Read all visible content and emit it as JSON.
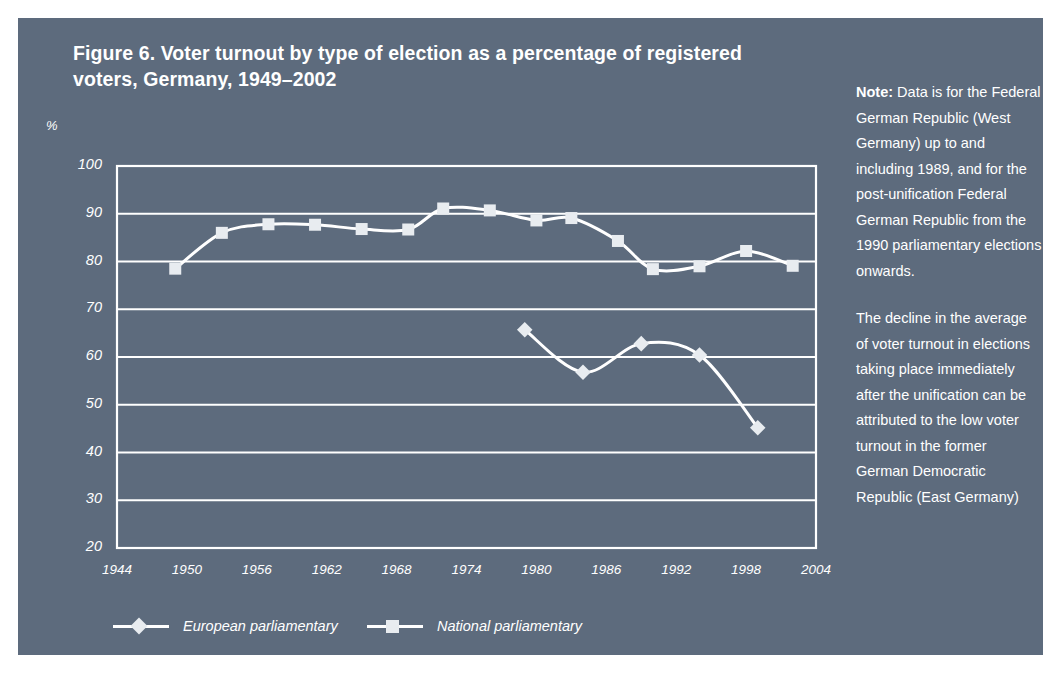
{
  "figure": {
    "title": "Figure 6. Voter turnout by type of election as a percentage of registered voters, Germany, 1949–2002",
    "panel_color": "#5d6b7d",
    "ink_color": "#ffffff",
    "marker_fill": "#e8ecf0"
  },
  "note": {
    "label": "Note:",
    "paragraph1": " Data is for the Federal German Republic (West Germany) up to and including 1989, and for the post-unification Federal German Republic from the 1990 parliamentary elections onwards.",
    "paragraph2": "The decline in the average of voter turnout in elections taking place immediately after the unification can be attributed to the low voter turnout in the former German Democratic Republic (East Germany)"
  },
  "chart_data": {
    "type": "line",
    "title": "Figure 6. Voter turnout by type of election as a percentage of registered voters, Germany, 1949–2002",
    "xlabel": "",
    "ylabel": "%",
    "xlim": [
      1944,
      2004
    ],
    "ylim": [
      20,
      100
    ],
    "xticks": [
      "1944",
      "1950",
      "1956",
      "1962",
      "1968",
      "1974",
      "1980",
      "1986",
      "1992",
      "1998",
      "2004"
    ],
    "yticks": [
      "100",
      "90",
      "80",
      "70",
      "60",
      "50",
      "40",
      "30",
      "20"
    ],
    "grid": true,
    "legend_position": "bottom",
    "series": [
      {
        "name": "European parliamentary",
        "marker": "diamond",
        "points": [
          {
            "x": 1979,
            "y": 65.7
          },
          {
            "x": 1984,
            "y": 56.8
          },
          {
            "x": 1989,
            "y": 62.8
          },
          {
            "x": 1994,
            "y": 60.4
          },
          {
            "x": 1999,
            "y": 45.2
          }
        ]
      },
      {
        "name": "National parliamentary",
        "marker": "square",
        "points": [
          {
            "x": 1949,
            "y": 78.5
          },
          {
            "x": 1953,
            "y": 86.0
          },
          {
            "x": 1957,
            "y": 87.8
          },
          {
            "x": 1961,
            "y": 87.7
          },
          {
            "x": 1965,
            "y": 86.8
          },
          {
            "x": 1969,
            "y": 86.7
          },
          {
            "x": 1972,
            "y": 91.1
          },
          {
            "x": 1976,
            "y": 90.7
          },
          {
            "x": 1980,
            "y": 88.6
          },
          {
            "x": 1983,
            "y": 89.1
          },
          {
            "x": 1987,
            "y": 84.3
          },
          {
            "x": 1990,
            "y": 78.4
          },
          {
            "x": 1994,
            "y": 79.0
          },
          {
            "x": 1998,
            "y": 82.2
          },
          {
            "x": 2002,
            "y": 79.1
          }
        ]
      }
    ]
  }
}
